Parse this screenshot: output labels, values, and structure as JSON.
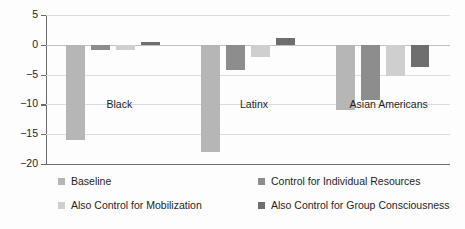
{
  "chart_data": {
    "type": "bar",
    "title": "",
    "subtitle": "",
    "xlabel": "",
    "ylabel": "",
    "categories": [
      "Black",
      "Latinx",
      "Asian Americans"
    ],
    "series": [
      {
        "name": "Baseline",
        "color": "#b6b6b6",
        "values": [
          -16.0,
          -18.0,
          -11.0
        ]
      },
      {
        "name": "Control for Individual Resources",
        "color": "#8d8d8d",
        "values": [
          -0.8,
          -4.3,
          -9.2
        ]
      },
      {
        "name": "Also Control for Mobilization",
        "color": "#cfcfcf",
        "values": [
          -0.9,
          -2.0,
          -5.3
        ]
      },
      {
        "name": "Also Control for Group Consciousness",
        "color": "#6f6f6f",
        "values": [
          0.4,
          1.2,
          -3.8
        ]
      }
    ],
    "ylim": [
      -20,
      5
    ],
    "yticks": [
      5,
      0,
      -5,
      -10,
      -15,
      -20
    ],
    "ytick_labels": [
      "5",
      "0",
      "−5",
      "−10",
      "−15",
      "−20"
    ],
    "grid": true,
    "legend_position": "bottom",
    "legend_columns": 2
  },
  "axis": {
    "zero_line_value": 0,
    "baseline_value": -20
  }
}
